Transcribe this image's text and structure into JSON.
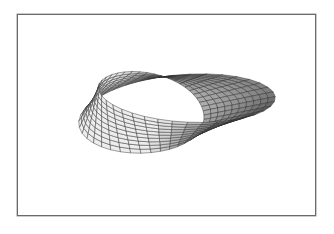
{
  "figure": {
    "frame": {
      "left": 17,
      "top": 14,
      "right": 316,
      "bottom": 216,
      "border_color": "#6a6a6a"
    },
    "surface": {
      "name": "mobius-strip",
      "center_x": 165,
      "center_y": 106,
      "radius_x": 62,
      "radius_y": 33,
      "half_width": 28,
      "tilt": 0.45,
      "u_steps": 40,
      "v_steps": 10,
      "grid_color": "#2a2a2a",
      "shade_light": "#e8e8e8",
      "shade_dark": "#6e6e6e"
    }
  }
}
